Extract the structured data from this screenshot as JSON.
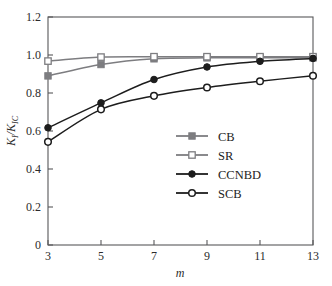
{
  "chart_data": {
    "type": "line",
    "title": "",
    "xlabel": "m",
    "ylabel": "K_I/K_IC",
    "ylabel_main": "K",
    "ylabel_sub1": "I",
    "ylabel_sep": "/",
    "ylabel_main2": "K",
    "ylabel_sub2": "IC",
    "x": [
      3,
      5,
      7,
      9,
      11,
      13
    ],
    "xlim": [
      3,
      13
    ],
    "ylim": [
      0,
      1.2
    ],
    "xticks": [
      "3",
      "5",
      "7",
      "9",
      "11",
      "13"
    ],
    "yticks": [
      "0",
      "0.2",
      "0.4",
      "0.6",
      "0.8",
      "1.0",
      "1.2"
    ],
    "ytick_values": [
      0,
      0.2,
      0.4,
      0.6,
      0.8,
      1.0,
      1.2
    ],
    "grid": false,
    "legend_position": "center-right",
    "series": [
      {
        "name": "CB",
        "values": [
          0.89,
          0.95,
          0.98,
          0.985,
          0.985,
          0.985
        ],
        "color": "#7d7d80",
        "marker": "filled-square"
      },
      {
        "name": "SR",
        "values": [
          0.968,
          0.989,
          0.991,
          0.991,
          0.991,
          0.991
        ],
        "color": "#7d7d80",
        "marker": "open-square"
      },
      {
        "name": "CCNBD",
        "values": [
          0.617,
          0.748,
          0.871,
          0.937,
          0.967,
          0.982
        ],
        "color": "#1d1d1d",
        "marker": "filled-circle"
      },
      {
        "name": "SCB",
        "values": [
          0.543,
          0.714,
          0.785,
          0.829,
          0.862,
          0.891
        ],
        "color": "#1d1d1d",
        "marker": "open-circle"
      }
    ]
  },
  "legend": {
    "entries": [
      {
        "label": "CB"
      },
      {
        "label": "SR"
      },
      {
        "label": "CCNBD"
      },
      {
        "label": "SCB"
      }
    ]
  }
}
